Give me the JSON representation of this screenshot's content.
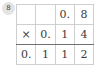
{
  "badge": {
    "label": "8",
    "icon": "circled-number-badge",
    "bg_color": "#e3e3e3",
    "text_color": "#4a4a4a"
  },
  "colors": {
    "page_background": "#ffffff",
    "grid_line": "#cfcfcf",
    "rule_line": "#6f6f6f",
    "digit_text": "#3b3b3b"
  },
  "problem": {
    "type": "long-multiplication",
    "multiplicand": "0.8",
    "operator": "×",
    "multiplier": "0.14",
    "product": "0.112",
    "columns": 4,
    "rows": 3
  },
  "grid": {
    "rows": [
      {
        "name": "multiplicand-row",
        "cells": [
          "",
          "",
          "0.",
          "8"
        ]
      },
      {
        "name": "multiplier-row",
        "cells": [
          "×",
          "0.",
          "1",
          "4"
        ]
      },
      {
        "name": "product-row",
        "cells": [
          "0.",
          "1",
          "1",
          "2"
        ]
      }
    ]
  }
}
